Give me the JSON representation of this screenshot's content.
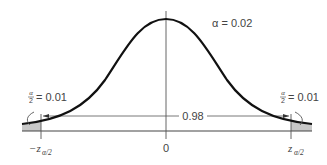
{
  "diagram": {
    "type": "normal-distribution-two-tailed",
    "alpha_label": "α = 0.02",
    "center_area_label": "0.98",
    "left_tail": {
      "fraction_numerator": "α",
      "fraction_denominator": "2",
      "value_label": "= 0.01",
      "critical_value_prefix": "−z",
      "critical_value_subscript": "α/2"
    },
    "right_tail": {
      "fraction_numerator": "α",
      "fraction_denominator": "2",
      "value_label": "= 0.01",
      "critical_value_prefix": "z",
      "critical_value_subscript": "α/2"
    },
    "mean_label": "0",
    "colors": {
      "curve": "#111111",
      "tail_fill": "#c8c8c8",
      "axis": "#444444",
      "text": "#444444"
    }
  }
}
